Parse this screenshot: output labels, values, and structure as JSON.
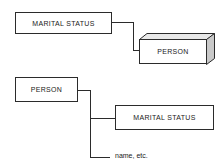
{
  "diagram": {
    "colors": {
      "stroke": "#2b2b2b",
      "background": "#ffffff",
      "shading_light": "#e8e8e8",
      "shading_mid": "#c9c9c9"
    },
    "top_structure": {
      "parent_box_label": "MARITAL STATUS",
      "child_box_label": "PERSON"
    },
    "bottom_structure": {
      "parent_box_label": "PERSON",
      "child_box_label": "MARITAL STATUS",
      "leaf_label": "name, etc."
    }
  }
}
